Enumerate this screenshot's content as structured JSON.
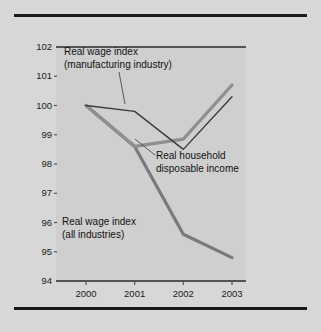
{
  "figure": {
    "background_color": "#d7d7d7",
    "plot_background_color": "#cfcfcf",
    "rule_color": "#1a1a1a"
  },
  "axes": {
    "ylabel": "Index numbers, 2000 = 100",
    "yticks": [
      "102",
      "101",
      "100",
      "99",
      "98",
      "97",
      "96",
      "95",
      "94"
    ],
    "xticks": [
      "2000",
      "2001",
      "2002",
      "2003"
    ]
  },
  "annotations": {
    "manufacturing": "Real wage index\n(manufacturing industry)",
    "household": "Real household\ndisposable income",
    "all_industries": "Real wage index\n(all industries)"
  },
  "colors": {
    "manufacturing_line": "#3a3a3a",
    "household_line": "#8f8f8f",
    "all_industries_line": "#7a7a7a",
    "leader_line": "#4a4a4a"
  },
  "chart_data": {
    "type": "line",
    "title": "",
    "xlabel": "",
    "ylabel": "Index numbers, 2000 = 100",
    "categories": [
      "2000",
      "2001",
      "2002",
      "2003"
    ],
    "x": [
      2000,
      2001,
      2002,
      2003
    ],
    "ylim": [
      94,
      102
    ],
    "xlim": [
      2000,
      2003
    ],
    "grid": false,
    "legend": "annotations-inline",
    "series": [
      {
        "name": "Real wage index (manufacturing industry)",
        "color": "#3a3a3a",
        "linewidth": 1.4,
        "values": [
          100.0,
          99.8,
          98.5,
          100.3
        ]
      },
      {
        "name": "Real household disposable income",
        "color": "#8f8f8f",
        "linewidth": 3.2,
        "values": [
          100.0,
          98.6,
          98.85,
          100.7
        ]
      },
      {
        "name": "Real wage index (all industries)",
        "color": "#7a7a7a",
        "linewidth": 3.2,
        "values": [
          100.0,
          98.6,
          95.6,
          94.8
        ]
      }
    ]
  }
}
